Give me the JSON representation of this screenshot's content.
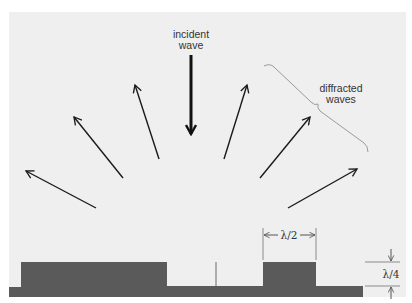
{
  "diagram": {
    "labels": {
      "incident_line1": "incident",
      "incident_line2": "wave",
      "diffracted_line1": "diffracted",
      "diffracted_line2": "waves",
      "width_dim": "λ/2",
      "height_dim": "λ/4"
    },
    "colors": {
      "panel": "#efefef",
      "surface": "#5a5a5a",
      "arrow": "#1a1a1a",
      "brace": "#9a9a9a",
      "dim_line": "#8a8a8a"
    },
    "arrows": {
      "incident": {
        "x1": 191,
        "y1": 55,
        "x2": 191,
        "y2": 134
      },
      "diffracted": [
        {
          "x1": 96,
          "y1": 208,
          "x2": 26,
          "y2": 171
        },
        {
          "x1": 123,
          "y1": 178,
          "x2": 74,
          "y2": 117
        },
        {
          "x1": 159,
          "y1": 159,
          "x2": 135,
          "y2": 85
        },
        {
          "x1": 224,
          "y1": 159,
          "x2": 247,
          "y2": 85
        },
        {
          "x1": 260,
          "y1": 178,
          "x2": 310,
          "y2": 117
        },
        {
          "x1": 288,
          "y1": 208,
          "x2": 357,
          "y2": 169
        }
      ]
    }
  }
}
